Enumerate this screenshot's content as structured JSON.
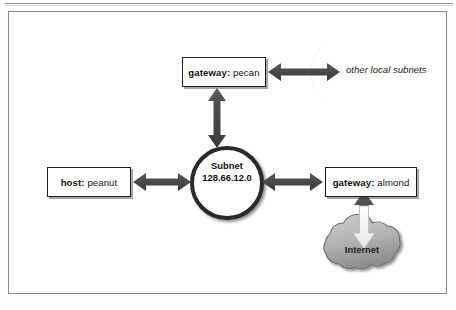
{
  "figure": {
    "type": "network-diagram",
    "title": "",
    "frame": {
      "border_color": "#8b8b8b",
      "background": "#ffffff"
    }
  },
  "nodes": {
    "gateway_pecan": {
      "role_label": "gateway:",
      "name_label": "pecan",
      "shape": "box"
    },
    "host_peanut": {
      "role_label": "host:",
      "name_label": "peanut",
      "shape": "box"
    },
    "gateway_almond": {
      "role_label": "gateway:",
      "name_label": "almond",
      "shape": "box"
    },
    "subnet": {
      "line1": "Subnet",
      "line2": "128.66.12.0",
      "shape": "circle"
    },
    "other_local_subnets": {
      "label": "other local subnets",
      "shape": "crescent-arc"
    },
    "internet": {
      "label": "Internet",
      "shape": "cloud"
    }
  },
  "links": [
    {
      "from": "gateway_pecan",
      "to": "other_local_subnets",
      "style": "double-arrow",
      "orientation": "horizontal"
    },
    {
      "from": "gateway_pecan",
      "to": "subnet",
      "style": "double-arrow",
      "orientation": "vertical"
    },
    {
      "from": "host_peanut",
      "to": "subnet",
      "style": "double-arrow",
      "orientation": "horizontal"
    },
    {
      "from": "subnet",
      "to": "gateway_almond",
      "style": "double-arrow",
      "orientation": "horizontal"
    },
    {
      "from": "internet",
      "to": "gateway_almond",
      "style": "double-arrow",
      "orientation": "vertical"
    }
  ],
  "colors": {
    "arrow": "#4a4a4a",
    "arrow_dark": "#3c3c3c",
    "outline": "#1d1d1d",
    "cloud_fill": "#b5b5b5",
    "cloud_edge": "#6f6f6f",
    "crescent": "#5a5a5a",
    "text": "#111111",
    "frame": "#8b8b8b",
    "page_background": "#ffffff"
  }
}
